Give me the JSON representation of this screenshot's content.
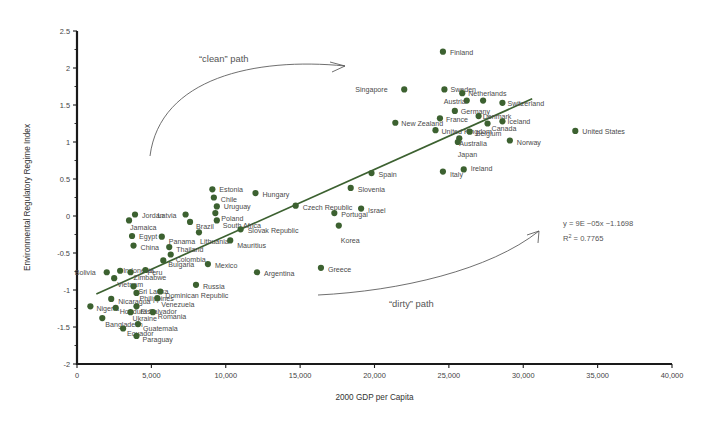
{
  "chart_data": {
    "type": "scatter",
    "title": "",
    "xlabel": "2000 GDP per Capita",
    "ylabel": "Environmental Regulatory Regime Index",
    "xlim": [
      0,
      40000
    ],
    "ylim": [
      -2,
      2.5
    ],
    "xticks": [
      "0",
      "5,000",
      "10,000",
      "15,000",
      "20,000",
      "25,000",
      "30,000",
      "35,000",
      "40,000"
    ],
    "xtick_values": [
      0,
      5000,
      10000,
      15000,
      20000,
      25000,
      30000,
      35000,
      40000
    ],
    "yticks": [
      "2.5",
      "2",
      "1.5",
      "1",
      "0.5",
      "0",
      "-0.5",
      "-1",
      "-1.5",
      "-2"
    ],
    "ytick_values": [
      2.5,
      2,
      1.5,
      1,
      0.5,
      0,
      -0.5,
      -1,
      -1.5,
      -2
    ],
    "grid": false,
    "legend": "none",
    "marker_color": "#3c6130",
    "trendline": {
      "equation": "y = 9E −05x −1.1698",
      "r2_label": "R",
      "r2_sup": "2",
      "r2_value": " = 0.7765",
      "slope": 9e-05,
      "intercept": -1.1698,
      "x_start": 1300,
      "x_end": 30600,
      "color": "#3c6130"
    },
    "annotations": [
      {
        "name": "clean-path",
        "text": "“clean” path"
      },
      {
        "name": "dirty-path",
        "text": "“dirty” path"
      }
    ],
    "points": [
      {
        "label": "Finland",
        "x": 24600,
        "y": 2.22,
        "lx": 7,
        "ly": 3
      },
      {
        "label": "Singapore",
        "x": 22000,
        "y": 1.71,
        "lx": -49,
        "ly": 3
      },
      {
        "label": "Sweden",
        "x": 24700,
        "y": 1.71,
        "lx": 6,
        "ly": 3
      },
      {
        "label": "Netherlands",
        "x": 25900,
        "y": 1.66,
        "lx": 6,
        "ly": 3
      },
      {
        "label": "Austria",
        "x": 26200,
        "y": 1.56,
        "lx": -23,
        "ly": 3
      },
      {
        "label": "Denmark2",
        "x": 27300,
        "y": 1.56,
        "lx": 900,
        "ly": 900
      },
      {
        "label": "Switzerland",
        "x": 28600,
        "y": 1.53,
        "lx": 5,
        "ly": 3
      },
      {
        "label": "Germany",
        "x": 25400,
        "y": 1.42,
        "lx": 6,
        "ly": 3
      },
      {
        "label": "France",
        "x": 24400,
        "y": 1.32,
        "lx": 6,
        "ly": 4
      },
      {
        "label": "Denmark",
        "x": 27000,
        "y": 1.35,
        "lx": 4,
        "ly": 3
      },
      {
        "label": "Iceland",
        "x": 28600,
        "y": 1.28,
        "lx": 5,
        "ly": 3
      },
      {
        "label": "Canada",
        "x": 27600,
        "y": 1.25,
        "lx": 4,
        "ly": 7
      },
      {
        "label": "New Zealand",
        "x": 21400,
        "y": 1.26,
        "lx": 6,
        "ly": 3
      },
      {
        "label": "United Kingdom",
        "x": 24100,
        "y": 1.16,
        "lx": 6,
        "ly": 4
      },
      {
        "label": "Belgium",
        "x": 26400,
        "y": 1.14,
        "lx": 6,
        "ly": 4
      },
      {
        "label": "United States",
        "x": 33500,
        "y": 1.15,
        "lx": 7,
        "ly": 3
      },
      {
        "label": "Australia",
        "x": 25700,
        "y": 1.05,
        "lx": 0,
        "ly": 8
      },
      {
        "label": "Japan",
        "x": 25600,
        "y": 1.0,
        "lx": 0,
        "ly": 15
      },
      {
        "label": "Norway",
        "x": 29100,
        "y": 1.02,
        "lx": 7,
        "ly": 4
      },
      {
        "label": "Ireland",
        "x": 26000,
        "y": 0.63,
        "lx": 7,
        "ly": 2
      },
      {
        "label": "Italy",
        "x": 24600,
        "y": 0.6,
        "lx": 7,
        "ly": 5
      },
      {
        "label": "Spain",
        "x": 19800,
        "y": 0.58,
        "lx": 7,
        "ly": 4
      },
      {
        "label": "Slovenia",
        "x": 18400,
        "y": 0.38,
        "lx": 7,
        "ly": 4
      },
      {
        "label": "Hungary",
        "x": 12000,
        "y": 0.31,
        "lx": 7,
        "ly": 4
      },
      {
        "label": "Estonia",
        "x": 9100,
        "y": 0.36,
        "lx": 7,
        "ly": 3
      },
      {
        "label": "Chile",
        "x": 9200,
        "y": 0.25,
        "lx": 7,
        "ly": 4
      },
      {
        "label": "Czech Republic",
        "x": 14700,
        "y": 0.14,
        "lx": 7,
        "ly": 4
      },
      {
        "label": "Uruguay",
        "x": 9400,
        "y": 0.13,
        "lx": 7,
        "ly": 3
      },
      {
        "label": "Israel",
        "x": 19100,
        "y": 0.1,
        "lx": 7,
        "ly": 4
      },
      {
        "label": "Portugal",
        "x": 17300,
        "y": 0.04,
        "lx": 7,
        "ly": 4
      },
      {
        "label": "Latvia",
        "x": 7300,
        "y": 0.02,
        "lx": -28,
        "ly": 3
      },
      {
        "label": "Poland",
        "x": 9300,
        "y": 0.04,
        "lx": 6,
        "ly": 8
      },
      {
        "label": "Jordan",
        "x": 3900,
        "y": 0.02,
        "lx": 7,
        "ly": 3
      },
      {
        "label": "Jamaica",
        "x": 3500,
        "y": -0.06,
        "lx": 1,
        "ly": 10
      },
      {
        "label": "Brazil",
        "x": 7600,
        "y": -0.08,
        "lx": 6,
        "ly": 7
      },
      {
        "label": "South Africa",
        "x": 9400,
        "y": -0.06,
        "lx": 6,
        "ly": 8
      },
      {
        "label": "Korea",
        "x": 17600,
        "y": -0.13,
        "lx": 2,
        "ly": 17
      },
      {
        "label": "Slovak Republic",
        "x": 11000,
        "y": -0.18,
        "lx": 7,
        "ly": 4
      },
      {
        "label": "Lithuania",
        "x": 8200,
        "y": -0.22,
        "lx": 1,
        "ly": 12
      },
      {
        "label": "Egypt",
        "x": 3700,
        "y": -0.27,
        "lx": 7,
        "ly": 3
      },
      {
        "label": "Panama",
        "x": 5700,
        "y": -0.28,
        "lx": 7,
        "ly": 7
      },
      {
        "label": "Mauritius",
        "x": 10300,
        "y": -0.33,
        "lx": 7,
        "ly": 8
      },
      {
        "label": "China",
        "x": 3800,
        "y": -0.4,
        "lx": 7,
        "ly": 4
      },
      {
        "label": "Thailand",
        "x": 6200,
        "y": -0.42,
        "lx": 7,
        "ly": 5
      },
      {
        "label": "Colombia",
        "x": 6300,
        "y": -0.52,
        "lx": 5,
        "ly": 8
      },
      {
        "label": "Mexico",
        "x": 8800,
        "y": -0.65,
        "lx": 7,
        "ly": 4
      },
      {
        "label": "Bulgaria",
        "x": 5800,
        "y": -0.6,
        "lx": 5,
        "ly": 7
      },
      {
        "label": "Greece",
        "x": 16400,
        "y": -0.7,
        "lx": 7,
        "ly": 4
      },
      {
        "label": "Argentina",
        "x": 12100,
        "y": -0.76,
        "lx": 7,
        "ly": 4
      },
      {
        "label": "Bolivia",
        "x": 2000,
        "y": -0.76,
        "lx": -32,
        "ly": 3
      },
      {
        "label": "Indonesia",
        "x": 2900,
        "y": -0.74,
        "lx": 3,
        "ly": 2
      },
      {
        "label": "Zimbabwe",
        "x": 3600,
        "y": -0.76,
        "lx": 3,
        "ly": 8
      },
      {
        "label": "Peru",
        "x": 4600,
        "y": -0.73,
        "lx": 2,
        "ly": 5
      },
      {
        "label": "Vietnam",
        "x": 2500,
        "y": -0.84,
        "lx": 3,
        "ly": 9
      },
      {
        "label": "Russia",
        "x": 8000,
        "y": -0.93,
        "lx": 7,
        "ly": 4
      },
      {
        "label": "Sri Lanka",
        "x": 3800,
        "y": -0.95,
        "lx": 5,
        "ly": 8
      },
      {
        "label": "Philippines",
        "x": 4000,
        "y": -1.04,
        "lx": 3,
        "ly": 8
      },
      {
        "label": "Dominican Republic",
        "x": 5600,
        "y": -1.02,
        "lx": 5,
        "ly": 7
      },
      {
        "label": "Venezuela",
        "x": 5400,
        "y": -1.11,
        "lx": 4,
        "ly": 9
      },
      {
        "label": "Nicaragua",
        "x": 2300,
        "y": -1.12,
        "lx": 7,
        "ly": 5
      },
      {
        "label": "Nigeria",
        "x": 900,
        "y": -1.22,
        "lx": 6,
        "ly": 5
      },
      {
        "label": "Honduras",
        "x": 2600,
        "y": -1.24,
        "lx": 4,
        "ly": 6
      },
      {
        "label": "El Salvador",
        "x": 4000,
        "y": -1.22,
        "lx": 4,
        "ly": 8
      },
      {
        "label": "Ukraine",
        "x": 3600,
        "y": -1.3,
        "lx": 2,
        "ly": 9
      },
      {
        "label": "Romania",
        "x": 5100,
        "y": -1.3,
        "lx": 5,
        "ly": 7
      },
      {
        "label": "Bangladesh",
        "x": 1700,
        "y": -1.38,
        "lx": 3,
        "ly": 9
      },
      {
        "label": "Guatemala",
        "x": 4100,
        "y": -1.46,
        "lx": 5,
        "ly": 7
      },
      {
        "label": "Ecuador",
        "x": 3100,
        "y": -1.52,
        "lx": 4,
        "ly": 8
      },
      {
        "label": "Paraguay",
        "x": 4000,
        "y": -1.62,
        "lx": 6,
        "ly": 6
      }
    ]
  }
}
